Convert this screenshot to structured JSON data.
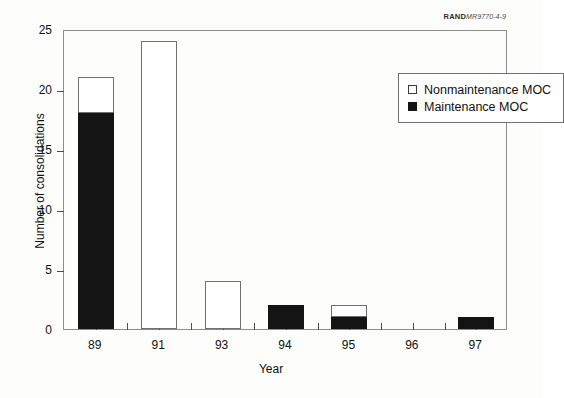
{
  "credit": {
    "brand": "RAND",
    "code": "MR9770-4-9"
  },
  "legend": {
    "items": [
      {
        "label": "Nonmaintenance MOC",
        "swatch": "open-square",
        "color": "#ffffff"
      },
      {
        "label": "Maintenance MOC",
        "swatch": "filled-square",
        "color": "#141414"
      }
    ]
  },
  "chart_data": {
    "type": "bar",
    "title": "",
    "xlabel": "Year",
    "ylabel": "Number of consolidations",
    "categories": [
      "89",
      "91",
      "93",
      "94",
      "95",
      "96",
      "97"
    ],
    "series": [
      {
        "name": "Maintenance MOC",
        "color": "#141414",
        "values": [
          18,
          0,
          0,
          2,
          1,
          0,
          1
        ]
      },
      {
        "name": "Nonmaintenance MOC",
        "color": "#ffffff",
        "values": [
          3,
          24,
          4,
          0,
          1,
          0,
          0
        ]
      }
    ],
    "totals": [
      21,
      24,
      4,
      2,
      2,
      0,
      1
    ],
    "stacked": true,
    "ylim": [
      0,
      25
    ],
    "yticks": [
      0,
      5,
      10,
      15,
      20,
      25
    ],
    "ytick_labels": [
      "0",
      "5",
      "10",
      "15",
      "20",
      "25"
    ],
    "grid": false,
    "legend_position": "top-right"
  }
}
